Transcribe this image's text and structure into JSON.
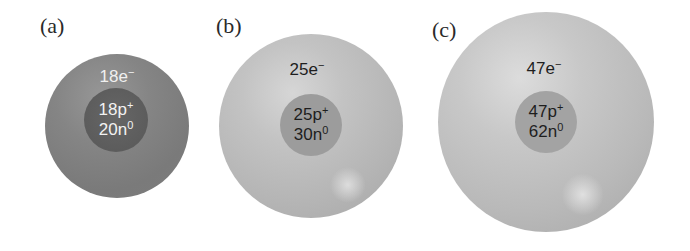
{
  "figure": {
    "panels": [
      {
        "label": "(a)",
        "electrons": {
          "count": "18e",
          "sign": "−"
        },
        "protons": {
          "count": "18p",
          "sign": "+"
        },
        "neutrons": {
          "count": "20n",
          "sign": "0"
        },
        "atom_color": "#858585",
        "nucleus_color": "#5e5e5e",
        "text_color": "#f0f0f0"
      },
      {
        "label": "(b)",
        "electrons": {
          "count": "25e",
          "sign": "−"
        },
        "protons": {
          "count": "25p",
          "sign": "+"
        },
        "neutrons": {
          "count": "30n",
          "sign": "0"
        },
        "atom_color": "#bdbdbd",
        "nucleus_color": "#9c9c9c",
        "text_color": "#1e1e1e"
      },
      {
        "label": "(c)",
        "electrons": {
          "count": "47e",
          "sign": "−"
        },
        "protons": {
          "count": "47p",
          "sign": "+"
        },
        "neutrons": {
          "count": "62n",
          "sign": "0"
        },
        "atom_color": "#c2c2c2",
        "nucleus_color": "#a3a3a3",
        "text_color": "#1e1e1e"
      }
    ]
  }
}
